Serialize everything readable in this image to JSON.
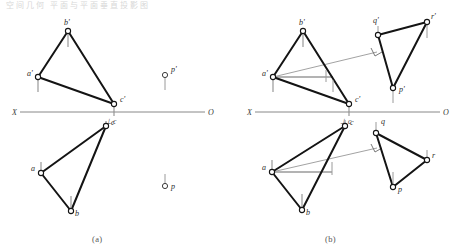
{
  "figure": {
    "title_note": "空间几何 平面与平面垂直投影图",
    "caption_a": "(a)",
    "caption_b": "(b)",
    "colors": {
      "stroke_main": "#141414",
      "stroke_thin": "#8a8a8a",
      "axis": "#6f6f6f",
      "vertex_fill": "#ffffff",
      "label": "#2b2b2b"
    }
  },
  "panel_a": {
    "name": "(a)",
    "axis": {
      "left_label": "X",
      "right_label": "O"
    },
    "upper_view": {
      "name": "front-view",
      "vertices": [
        {
          "id": "b-prime",
          "label": "b'",
          "x": 68,
          "y": 31
        },
        {
          "id": "a-prime",
          "label": "a'",
          "x": 38,
          "y": 77
        },
        {
          "id": "c-prime",
          "label": "c'",
          "x": 114,
          "y": 104
        }
      ]
    },
    "lower_view": {
      "name": "top-view",
      "vertices": [
        {
          "id": "c",
          "label": "c",
          "x": 106,
          "y": 126
        },
        {
          "id": "a",
          "label": "a",
          "x": 41,
          "y": 173
        },
        {
          "id": "b",
          "label": "b",
          "x": 71,
          "y": 211
        }
      ]
    },
    "axis_mark": {
      "label": "c",
      "prefix": "⊥"
    },
    "isolated_points": [
      {
        "id": "d-prime",
        "label": "p'",
        "x": 165,
        "y": 75,
        "tick": "up"
      },
      {
        "id": "d",
        "label": "p",
        "x": 165,
        "y": 186,
        "tick": "up"
      }
    ]
  },
  "panel_b": {
    "name": "(b)",
    "axis": {
      "left_label": "X",
      "right_label": "O"
    },
    "upper_view": {
      "name": "front-view",
      "triangle_left": [
        {
          "id": "b-prime",
          "label": "b'",
          "x": 303,
          "y": 31
        },
        {
          "id": "a-prime",
          "label": "a'",
          "x": 273,
          "y": 77
        },
        {
          "id": "c-prime",
          "label": "c'",
          "x": 349,
          "y": 104
        }
      ],
      "triangle_right": [
        {
          "id": "q-prime",
          "label": "q'",
          "x": 378,
          "y": 35
        },
        {
          "id": "r-prime",
          "label": "r'",
          "x": 427,
          "y": 22
        },
        {
          "id": "p-prime",
          "label": "p'",
          "x": 393,
          "y": 88
        }
      ],
      "perp_foot": {
        "x": 377,
        "y": 52
      }
    },
    "lower_view": {
      "name": "top-view",
      "triangle_left": [
        {
          "id": "c",
          "label": "c",
          "x": 345,
          "y": 126
        },
        {
          "id": "a",
          "label": "a",
          "x": 272,
          "y": 172
        },
        {
          "id": "b",
          "label": "b",
          "x": 302,
          "y": 210
        }
      ],
      "triangle_right": [
        {
          "id": "q",
          "label": "q",
          "x": 376,
          "y": 133
        },
        {
          "id": "r",
          "label": "r",
          "x": 427,
          "y": 160
        },
        {
          "id": "p",
          "label": "p",
          "x": 393,
          "y": 187
        }
      ],
      "perp_foot": {
        "x": 377,
        "y": 148
      }
    },
    "axis_mark": {
      "label": "c",
      "prefix": "⊥"
    }
  }
}
